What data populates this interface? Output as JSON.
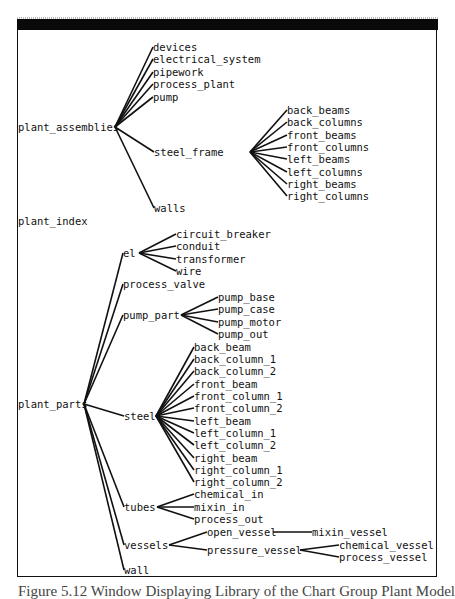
{
  "window": {
    "title": "[] [index] Library PLANT"
  },
  "caption": "Figure 5.12  Window Displaying Library of the Chart Group Plant Model",
  "tree": {
    "root_nodes": [
      {
        "id": "plant_assemblies",
        "label": "plant_assemblies",
        "x": 18,
        "y": 127,
        "ax": 115
      },
      {
        "id": "plant_index",
        "label": "plant_index",
        "x": 18,
        "y": 221
      },
      {
        "id": "plant_parts",
        "label": "plant_parts",
        "x": 18,
        "y": 404,
        "ax": 84
      }
    ],
    "nodes": [
      {
        "id": "devices",
        "label": "devices",
        "x": 153,
        "y": 47,
        "parent": "plant_assemblies"
      },
      {
        "id": "electrical_system",
        "label": "electrical_system",
        "x": 153,
        "y": 59,
        "parent": "plant_assemblies"
      },
      {
        "id": "pipework",
        "label": "pipework",
        "x": 153,
        "y": 72,
        "parent": "plant_assemblies"
      },
      {
        "id": "process_plant",
        "label": "process_plant",
        "x": 153,
        "y": 84,
        "parent": "plant_assemblies"
      },
      {
        "id": "pump",
        "label": "pump",
        "x": 153,
        "y": 97,
        "parent": "plant_assemblies"
      },
      {
        "id": "steel_frame",
        "label": "steel_frame",
        "x": 154,
        "y": 152,
        "parent": "plant_assemblies",
        "ax": 250
      },
      {
        "id": "walls",
        "label": "walls",
        "x": 154,
        "y": 208,
        "parent": "plant_assemblies"
      },
      {
        "id": "back_beams",
        "label": "back_beams",
        "x": 287,
        "y": 110,
        "parent": "steel_frame"
      },
      {
        "id": "back_columns",
        "label": "back_columns",
        "x": 287,
        "y": 122,
        "parent": "steel_frame"
      },
      {
        "id": "front_beams",
        "label": "front_beams",
        "x": 287,
        "y": 135,
        "parent": "steel_frame"
      },
      {
        "id": "front_columns",
        "label": "front_columns",
        "x": 287,
        "y": 147,
        "parent": "steel_frame"
      },
      {
        "id": "left_beams",
        "label": "left_beams",
        "x": 287,
        "y": 159,
        "parent": "steel_frame"
      },
      {
        "id": "left_columns",
        "label": "left_columns",
        "x": 287,
        "y": 172,
        "parent": "steel_frame"
      },
      {
        "id": "right_beams",
        "label": "right_beams",
        "x": 287,
        "y": 184,
        "parent": "steel_frame"
      },
      {
        "id": "right_columns",
        "label": "right_columns",
        "x": 287,
        "y": 196,
        "parent": "steel_frame"
      },
      {
        "id": "el",
        "label": "el",
        "x": 123,
        "y": 253,
        "parent": "plant_parts",
        "ax": 139
      },
      {
        "id": "process_valve",
        "label": "process_valve",
        "x": 123,
        "y": 284,
        "parent": "plant_parts"
      },
      {
        "id": "pump_part",
        "label": "pump_part",
        "x": 123,
        "y": 315,
        "parent": "plant_parts",
        "ax": 181
      },
      {
        "id": "steel",
        "label": "steel",
        "x": 124,
        "y": 416,
        "parent": "plant_parts",
        "ax": 156
      },
      {
        "id": "tubes",
        "label": "tubes",
        "x": 124,
        "y": 507,
        "parent": "plant_parts",
        "ax": 157
      },
      {
        "id": "vessels",
        "label": "vessels",
        "x": 124,
        "y": 545,
        "parent": "plant_parts",
        "ax": 169
      },
      {
        "id": "wall",
        "label": "wall",
        "x": 124,
        "y": 570,
        "parent": "plant_parts"
      },
      {
        "id": "circuit_breaker",
        "label": "circuit_breaker",
        "x": 176,
        "y": 234,
        "parent": "el"
      },
      {
        "id": "conduit",
        "label": "conduit",
        "x": 176,
        "y": 246,
        "parent": "el"
      },
      {
        "id": "transformer",
        "label": "transformer",
        "x": 176,
        "y": 259,
        "parent": "el"
      },
      {
        "id": "wire",
        "label": "wire",
        "x": 176,
        "y": 271,
        "parent": "el"
      },
      {
        "id": "pump_base",
        "label": "pump_base",
        "x": 218,
        "y": 297,
        "parent": "pump_part"
      },
      {
        "id": "pump_case",
        "label": "pump_case",
        "x": 218,
        "y": 309,
        "parent": "pump_part"
      },
      {
        "id": "pump_motor",
        "label": "pump_motor",
        "x": 218,
        "y": 322,
        "parent": "pump_part"
      },
      {
        "id": "pump_out",
        "label": "pump_out",
        "x": 218,
        "y": 334,
        "parent": "pump_part"
      },
      {
        "id": "back_beam",
        "label": "back_beam",
        "x": 194,
        "y": 347,
        "parent": "steel"
      },
      {
        "id": "back_column_1",
        "label": "back_column_1",
        "x": 194,
        "y": 359,
        "parent": "steel"
      },
      {
        "id": "back_column_2",
        "label": "back_column_2",
        "x": 194,
        "y": 371,
        "parent": "steel"
      },
      {
        "id": "front_beam",
        "label": "front_beam",
        "x": 194,
        "y": 384,
        "parent": "steel"
      },
      {
        "id": "front_column_1",
        "label": "front_column_1",
        "x": 194,
        "y": 396,
        "parent": "steel"
      },
      {
        "id": "front_column_2",
        "label": "front_column_2",
        "x": 194,
        "y": 408,
        "parent": "steel"
      },
      {
        "id": "left_beam",
        "label": "left_beam",
        "x": 194,
        "y": 421,
        "parent": "steel"
      },
      {
        "id": "left_column_1",
        "label": "left_column_1",
        "x": 194,
        "y": 433,
        "parent": "steel"
      },
      {
        "id": "left_column_2",
        "label": "left_column_2",
        "x": 194,
        "y": 445,
        "parent": "steel"
      },
      {
        "id": "right_beam",
        "label": "right_beam",
        "x": 194,
        "y": 458,
        "parent": "steel"
      },
      {
        "id": "right_column_1",
        "label": "right_column_1",
        "x": 194,
        "y": 470,
        "parent": "steel"
      },
      {
        "id": "right_column_2",
        "label": "right_column_2",
        "x": 194,
        "y": 482,
        "parent": "steel"
      },
      {
        "id": "chemical_in",
        "label": "chemical_in",
        "x": 194,
        "y": 494,
        "parent": "tubes"
      },
      {
        "id": "mixin_in",
        "label": "mixin_in",
        "x": 194,
        "y": 507,
        "parent": "tubes"
      },
      {
        "id": "process_out",
        "label": "process_out",
        "x": 194,
        "y": 519,
        "parent": "tubes"
      },
      {
        "id": "open_vessel",
        "label": "open_vessel",
        "x": 207,
        "y": 532,
        "parent": "vessels",
        "ax": 273
      },
      {
        "id": "pressure_vessel",
        "label": "pressure_vessel",
        "x": 207,
        "y": 550,
        "parent": "vessels",
        "ax": 300
      },
      {
        "id": "mixin_vessel",
        "label": "mixin_vessel",
        "x": 312,
        "y": 532,
        "parent": "open_vessel"
      },
      {
        "id": "chemical_vessel",
        "label": "chemical_vessel",
        "x": 339,
        "y": 545,
        "parent": "pressure_vessel"
      },
      {
        "id": "process_vessel",
        "label": "process_vessel",
        "x": 339,
        "y": 557,
        "parent": "pressure_vessel"
      }
    ]
  }
}
